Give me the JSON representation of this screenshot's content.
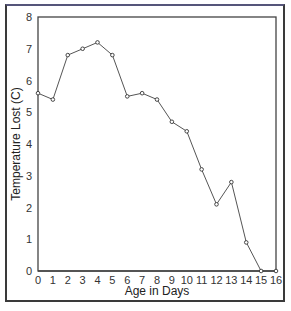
{
  "chart_data": {
    "type": "line",
    "title": "",
    "xlabel": "Age in Days",
    "ylabel": "Temperature Lost (C)",
    "x": [
      0,
      1,
      2,
      3,
      4,
      5,
      6,
      7,
      8,
      9,
      10,
      11,
      12,
      13,
      14,
      15,
      16
    ],
    "series": [
      {
        "name": "Temperature Lost",
        "values": [
          5.6,
          5.4,
          6.8,
          7.0,
          7.2,
          6.8,
          5.5,
          5.6,
          5.4,
          4.7,
          4.4,
          3.2,
          2.1,
          2.8,
          0.9,
          0.0,
          0.0
        ]
      }
    ],
    "xlim": [
      0,
      16
    ],
    "ylim": [
      0,
      8
    ],
    "xticks": [
      "0",
      "1",
      "2",
      "3",
      "4",
      "5",
      "6",
      "7",
      "8",
      "9",
      "10",
      "11",
      "12",
      "13",
      "14",
      "15",
      "16"
    ],
    "yticks": [
      "0",
      "1",
      "2",
      "3",
      "4",
      "5",
      "6",
      "7",
      "8"
    ],
    "grid": false,
    "legend": "none",
    "markers": "open-circle",
    "line_color": "#555555"
  }
}
